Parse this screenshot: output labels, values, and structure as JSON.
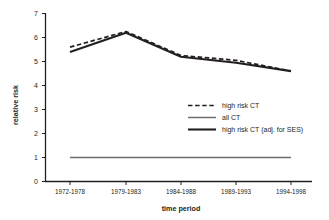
{
  "chart_data": {
    "type": "line",
    "title": "",
    "xlabel": "time period",
    "ylabel": "relative risk",
    "categories": [
      "1972-1978",
      "1979-1983",
      "1984-1988",
      "1989-1993",
      "1994-1998"
    ],
    "ylim": [
      0,
      7
    ],
    "yticks": [
      0,
      1,
      2,
      3,
      4,
      5,
      6,
      7
    ],
    "grid": false,
    "legend_position": "center-right",
    "series": [
      {
        "name": "high risk CT",
        "style": "dashed",
        "color": "#231f20",
        "values": [
          5.6,
          6.25,
          5.25,
          5.05,
          4.6
        ]
      },
      {
        "name": "all CT",
        "style": "solid-thin",
        "color": "#6d6e71",
        "values": [
          1.0,
          1.0,
          1.0,
          1.0,
          1.0
        ]
      },
      {
        "name": "high risk CT (adj. for SES)",
        "style": "solid-thick",
        "color": "#231f20",
        "values": [
          5.4,
          6.2,
          5.2,
          4.95,
          4.6
        ]
      }
    ]
  },
  "axes": {
    "y_label": "relative risk",
    "x_label": "time period",
    "y_tick_labels": [
      "0",
      "1",
      "2",
      "3",
      "4",
      "5",
      "6",
      "7"
    ],
    "x_tick_labels": [
      "1972-1978",
      "1979-1983",
      "1984-1988",
      "1989-1993",
      "1994-1998"
    ]
  },
  "legend": {
    "items": [
      {
        "label": "high risk CT"
      },
      {
        "label": "all CT"
      },
      {
        "label": "high risk CT (adj. for SES)"
      }
    ]
  },
  "colors": {
    "axis": "#231f20",
    "series_dark": "#231f20",
    "series_gray": "#6d6e71",
    "background": "#ffffff"
  }
}
